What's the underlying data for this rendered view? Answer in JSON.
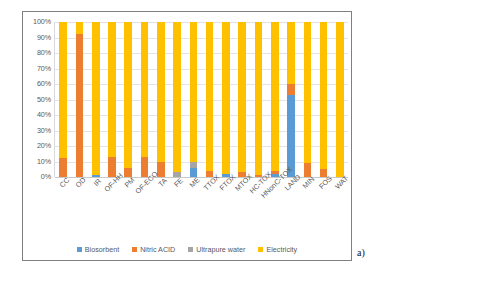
{
  "figure": {
    "subfigure_label": "a)"
  },
  "legend": {
    "position": "bottom-center",
    "items": [
      {
        "label": "Biosorbent",
        "color": "#5B9BD5"
      },
      {
        "label": "Nitric ACID",
        "color": "#ED7D31"
      },
      {
        "label": "Ultrapure water",
        "color": "#A5A5A5"
      },
      {
        "label": "Electricity",
        "color": "#FFC000"
      }
    ]
  },
  "chart_data": {
    "type": "bar",
    "subtype": "stacked-100-percent",
    "title": "",
    "xlabel": "",
    "ylabel": "",
    "ylim": [
      0,
      100
    ],
    "grid": true,
    "legend_position": "bottom",
    "ytick_labels": [
      "100%",
      "90%",
      "80%",
      "70%",
      "60%",
      "50%",
      "40%",
      "30%",
      "20%",
      "10%",
      "0%"
    ],
    "ytick_values": [
      100,
      90,
      80,
      70,
      60,
      50,
      40,
      30,
      20,
      10,
      0
    ],
    "categories": [
      "CC",
      "OD",
      "IR",
      "OF-HH",
      "PM",
      "OF-ECO",
      "TA",
      "FE",
      "ME",
      "TTOX",
      "FTOX",
      "MTOX",
      "HC-TOX",
      "HNonC-TOX",
      "LAND",
      "MIN",
      "FOS",
      "WAT"
    ],
    "series": [
      {
        "name": "Biosorbent",
        "color": "#5B9BD5",
        "values": [
          0,
          0,
          1,
          0,
          0,
          0,
          0,
          0,
          6,
          0,
          2,
          0,
          0,
          2,
          53,
          0,
          0,
          0
        ]
      },
      {
        "name": "Nitric ACID",
        "color": "#ED7D31",
        "values": [
          12,
          92,
          0,
          13,
          6,
          13,
          10,
          0,
          0,
          4,
          0,
          3,
          1,
          2,
          7,
          9,
          5,
          0
        ]
      },
      {
        "name": "Ultrapure water",
        "color": "#A5A5A5",
        "values": [
          0,
          0,
          0,
          0,
          0,
          0,
          0,
          3,
          4,
          0,
          0,
          0,
          0,
          0,
          0,
          0,
          0,
          0
        ]
      },
      {
        "name": "Electricity",
        "color": "#FFC000",
        "values": [
          88,
          8,
          99,
          87,
          94,
          87,
          90,
          97,
          90,
          96,
          98,
          97,
          99,
          96,
          40,
          91,
          95,
          100
        ]
      }
    ]
  }
}
